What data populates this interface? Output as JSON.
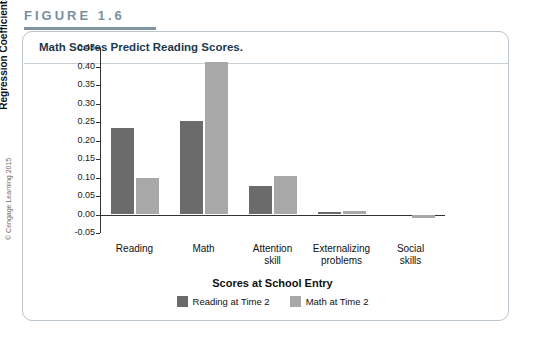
{
  "figure": {
    "label": "FIGURE 1.6",
    "caption": "Math Scores Predict Reading Scores.",
    "copyright": "© Cengage Learning 2015"
  },
  "colors": {
    "series1": "#6b6b6b",
    "series2": "#a8a8a8",
    "card_border": "#b9c4cc",
    "rule": "#7f94a2",
    "label_text": "#7a8f9e"
  },
  "chart_data": {
    "type": "bar",
    "title": "Math Scores Predict Reading Scores.",
    "xlabel": "Scores at School Entry",
    "ylabel": "Standardized Regression Coefficients",
    "categories": [
      "Reading",
      "Math",
      "Attention skill",
      "Externalizing problems",
      "Social skills"
    ],
    "category_lines": [
      [
        "Reading"
      ],
      [
        "Math"
      ],
      [
        "Attention",
        "skill"
      ],
      [
        "Externalizing",
        "problems"
      ],
      [
        "Social",
        "skills"
      ]
    ],
    "series": [
      {
        "name": "Reading at Time 2",
        "color": "#6b6b6b",
        "values": [
          0.235,
          0.252,
          0.077,
          0.008,
          0.0
        ]
      },
      {
        "name": "Math at Time 2",
        "color": "#a8a8a8",
        "values": [
          0.098,
          0.413,
          0.105,
          0.009,
          -0.009
        ]
      }
    ],
    "ylim": [
      -0.05,
      0.45
    ],
    "yticks": [
      -0.05,
      0.0,
      0.05,
      0.1,
      0.15,
      0.2,
      0.25,
      0.3,
      0.35,
      0.4,
      0.45
    ],
    "ytick_labels": [
      "-0.05",
      "0.00",
      "0.05",
      "0.10",
      "0.15",
      "0.20",
      "0.25",
      "0.30",
      "0.35",
      "0.40",
      "0.45"
    ],
    "grid": false,
    "legend_position": "bottom"
  }
}
